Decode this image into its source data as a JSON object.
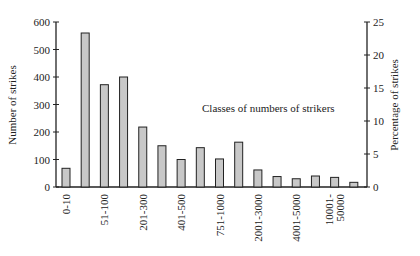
{
  "chart_data": {
    "type": "bar",
    "title": "",
    "annotation": "Classes of numbers of strikers",
    "xlabel": "",
    "ylabel": "Number of strikes",
    "ylabel_right": "Percentage of strikes",
    "ylim": [
      0,
      600
    ],
    "ylim_right": [
      0,
      25
    ],
    "yticks": [
      0,
      100,
      200,
      300,
      400,
      500,
      600
    ],
    "yticks_right": [
      0,
      5,
      10,
      15,
      20,
      25
    ],
    "categories": [
      "0-10",
      "11-50",
      "51-100",
      "101-200",
      "201-300",
      "301-400",
      "401-500",
      "501-750",
      "751-1000",
      "1001-2000",
      "2001-3000",
      "3001-4000",
      "4001-5000",
      "5001-10000",
      "10001-50000",
      ">50000"
    ],
    "visible_tick_labels": [
      "0-10",
      "51-100",
      "201-300",
      "401-500",
      "751-1000",
      "2001-3000",
      "4001-5000",
      "10001-\n50000"
    ],
    "values": [
      68,
      560,
      372,
      400,
      218,
      150,
      100,
      143,
      102,
      163,
      62,
      38,
      30,
      40,
      35,
      17
    ],
    "bar_color": "#c8c8c8",
    "grid": false,
    "legend": null
  }
}
